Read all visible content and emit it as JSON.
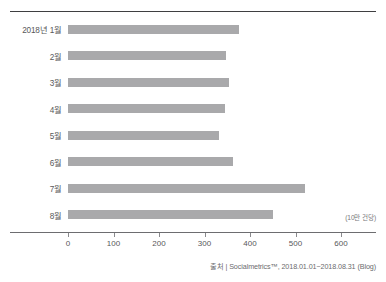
{
  "chart_data": {
    "type": "bar",
    "orientation": "horizontal",
    "title": "",
    "xlabel": "",
    "ylabel": "",
    "unit_caption": "(10만 건당)",
    "categories": [
      "2018년 1월",
      "2월",
      "3월",
      "4월",
      "5월",
      "6월",
      "7월",
      "8월"
    ],
    "values": [
      376,
      347,
      354,
      345,
      332,
      363,
      521,
      451
    ],
    "series": [
      {
        "name": "월별 건수",
        "values": [
          376,
          347,
          354,
          345,
          332,
          363,
          521,
          451
        ]
      }
    ],
    "xlim": [
      0,
      650
    ],
    "xticks": [
      0,
      100,
      200,
      300,
      400,
      500,
      600
    ],
    "xtick_labels": [
      "0",
      "100",
      "200",
      "300",
      "400",
      "500",
      "600"
    ],
    "grid": false,
    "legend": false,
    "bar_color": "#a9a9ab",
    "axis_color": "#6d6d70",
    "text_color": "#58585a"
  },
  "source": {
    "text": "출처 | Socialmetrics™, 2018.01.01~2018.08.31 (Blog)"
  }
}
